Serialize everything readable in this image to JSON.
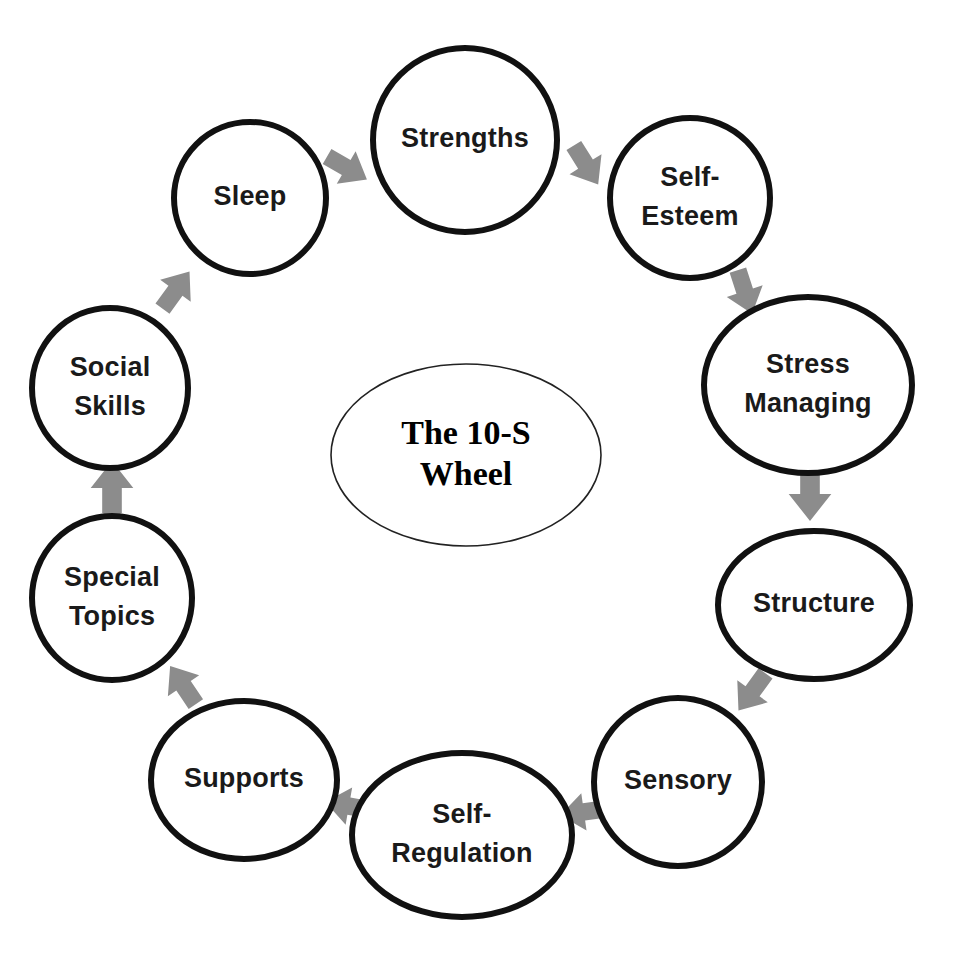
{
  "diagram": {
    "title": "The 10-S Wheel",
    "hub": {
      "line1": "The 10-S",
      "line2": "Wheel"
    },
    "accent_color": "#8c8c8c",
    "node_stroke_color": "#111111",
    "background_color": "#ffffff",
    "node_count": 10,
    "nodes": [
      {
        "id": "strengths",
        "label_line1": "Strengths",
        "label_line2": "",
        "shape": "circle",
        "cx": 465,
        "cy": 140,
        "rx": 92,
        "ry": 92
      },
      {
        "id": "self-esteem",
        "label_line1": "Self-",
        "label_line2": "Esteem",
        "shape": "circle",
        "cx": 690,
        "cy": 198,
        "rx": 80,
        "ry": 80
      },
      {
        "id": "stress-managing",
        "label_line1": "Stress",
        "label_line2": "Managing",
        "shape": "ellipse",
        "cx": 808,
        "cy": 385,
        "rx": 104,
        "ry": 88
      },
      {
        "id": "structure",
        "label_line1": "Structure",
        "label_line2": "",
        "shape": "ellipse",
        "cx": 814,
        "cy": 605,
        "rx": 96,
        "ry": 74
      },
      {
        "id": "sensory",
        "label_line1": "Sensory",
        "label_line2": "",
        "shape": "circle",
        "cx": 678,
        "cy": 782,
        "rx": 84,
        "ry": 84
      },
      {
        "id": "self-regulation",
        "label_line1": "Self-",
        "label_line2": "Regulation",
        "shape": "ellipse",
        "cx": 462,
        "cy": 835,
        "rx": 110,
        "ry": 82
      },
      {
        "id": "supports",
        "label_line1": "Supports",
        "label_line2": "",
        "shape": "ellipse",
        "cx": 244,
        "cy": 780,
        "rx": 93,
        "ry": 79
      },
      {
        "id": "special-topics",
        "label_line1": "Special",
        "label_line2": "Topics",
        "shape": "circle",
        "cx": 112,
        "cy": 598,
        "rx": 80,
        "ry": 82
      },
      {
        "id": "social-skills",
        "label_line1": "Social",
        "label_line2": "Skills",
        "shape": "circle",
        "cx": 110,
        "cy": 388,
        "rx": 78,
        "ry": 80
      },
      {
        "id": "sleep",
        "label_line1": "Sleep",
        "label_line2": "",
        "shape": "circle",
        "cx": 250,
        "cy": 198,
        "rx": 76,
        "ry": 76
      }
    ],
    "arrows": [
      {
        "id": "sleep-to-strengths",
        "from": "sleep",
        "to": "strengths",
        "cx": 347,
        "cy": 168,
        "angle": 30,
        "size": 46
      },
      {
        "id": "strengths-to-self-esteem",
        "from": "strengths",
        "to": "self-esteem",
        "cx": 586,
        "cy": 165,
        "angle": 58,
        "size": 46
      },
      {
        "id": "self-esteem-to-stress-managing",
        "from": "self-esteem",
        "to": "stress-managing",
        "cx": 745,
        "cy": 292,
        "angle": 72,
        "size": 46
      },
      {
        "id": "stress-managing-to-structure",
        "from": "stress-managing",
        "to": "structure",
        "cx": 810,
        "cy": 495,
        "angle": 90,
        "size": 52
      },
      {
        "id": "structure-to-sensory",
        "from": "structure",
        "to": "sensory",
        "cx": 752,
        "cy": 692,
        "angle": 126,
        "size": 46
      },
      {
        "id": "sensory-to-self-regulation",
        "from": "sensory",
        "to": "self-regulation",
        "cx": 583,
        "cy": 812,
        "angle": 172,
        "size": 46
      },
      {
        "id": "self-regulation-to-supports",
        "from": "self-regulation",
        "to": "supports",
        "cx": 348,
        "cy": 806,
        "angle": 190,
        "size": 46
      },
      {
        "id": "supports-to-special-topics",
        "from": "supports",
        "to": "special-topics",
        "cx": 183,
        "cy": 685,
        "angle": 236,
        "size": 46
      },
      {
        "id": "special-topics-to-social-skills",
        "from": "special-topics",
        "to": "social-skills",
        "cx": 112,
        "cy": 487,
        "angle": 270,
        "size": 52
      },
      {
        "id": "social-skills-to-sleep",
        "from": "social-skills",
        "to": "sleep",
        "cx": 176,
        "cy": 290,
        "angle": 306,
        "size": 46
      }
    ],
    "hub_geometry": {
      "cx": 466,
      "cy": 455,
      "rx": 135,
      "ry": 91
    }
  }
}
